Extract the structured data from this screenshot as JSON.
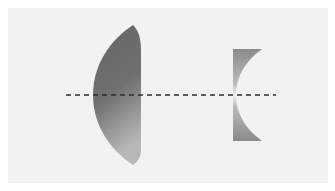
{
  "diagram": {
    "title": "Converging and diverging lenses on an optical axis",
    "background_color": "#f2f2f2",
    "elements": [
      {
        "id": "convex-lens",
        "type": "plano-convex lens",
        "color_top": "#666666",
        "color_bottom": "#b4b4b4"
      },
      {
        "id": "concave-lens",
        "type": "plano-concave lens",
        "color_edge": "#8a8a8a",
        "color_center": "#f0f0f0"
      },
      {
        "id": "optical-axis",
        "type": "dashed line",
        "color": "#333333"
      }
    ]
  }
}
